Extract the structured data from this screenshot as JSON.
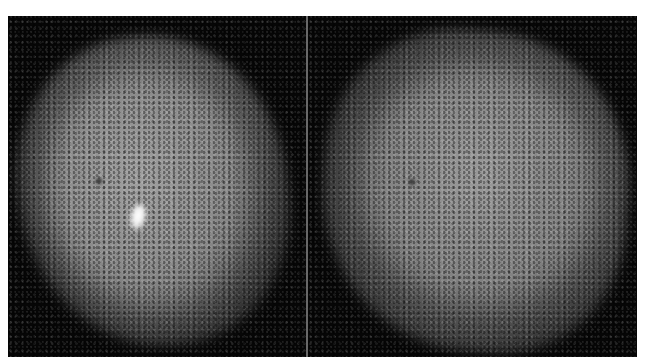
{
  "figure": {
    "colors": {
      "background": "#050505",
      "blob_mid": "#8a8a8a",
      "hotspot": "#ffffff",
      "divider": "#8a8a8a",
      "page": "#ffffff"
    },
    "panels": [
      {
        "id": "left",
        "hotspot": {
          "x": 130,
          "y": 200
        },
        "coldspot": {
          "x": 90,
          "y": 164
        }
      },
      {
        "id": "right",
        "coldspot": {
          "x": 104,
          "y": 166
        }
      }
    ]
  }
}
